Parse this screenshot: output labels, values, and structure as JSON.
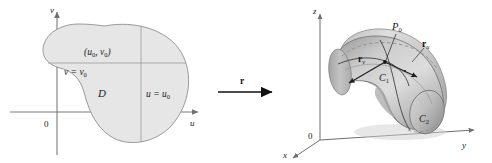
{
  "figure": {
    "background_color": "#ffffff",
    "width": 492,
    "height": 163,
    "caption": "Parameter domain D in the uv-plane mapped by r to a parametric surface in xyz-space"
  },
  "colors": {
    "region_fill": "#e6e6e6",
    "region_stroke": "#8c8c8c",
    "axis": "#7a7a7a",
    "grid_line": "#9a9a9a",
    "surface_light": "#dcdcdc",
    "surface_mid": "#c2c2c2",
    "surface_dark": "#a4a4a4",
    "curve": "#4a4a4a",
    "text": "#1a1a1a"
  },
  "left_panel": {
    "name": "uv-parameter-plane",
    "axes": {
      "vertical_label": "v",
      "horizontal_label": "u",
      "origin_label": "0"
    },
    "region_label": "D",
    "point_label": "(u",
    "point_label_sub1": "0",
    "point_label_mid": ", v",
    "point_label_sub2": "0",
    "point_label_close": ")",
    "v_constant_label": "v = v",
    "v_constant_sub": "0",
    "u_constant_label": "u = u",
    "u_constant_sub": "0"
  },
  "arrow": {
    "name": "mapping-arrow",
    "label": "r"
  },
  "right_panel": {
    "name": "xyz-surface-space",
    "axes": {
      "vertical_label": "z",
      "depth_label": "x",
      "horizontal_label": "y",
      "origin_label": "0"
    },
    "point_label": "P",
    "point_sub": "0",
    "tangent_v_label": "r",
    "tangent_v_sub": "v",
    "tangent_u_label": "r",
    "tangent_u_sub": "u",
    "curve1_label": "C",
    "curve1_sub": "1",
    "curve2_label": "C",
    "curve2_sub": "2"
  }
}
